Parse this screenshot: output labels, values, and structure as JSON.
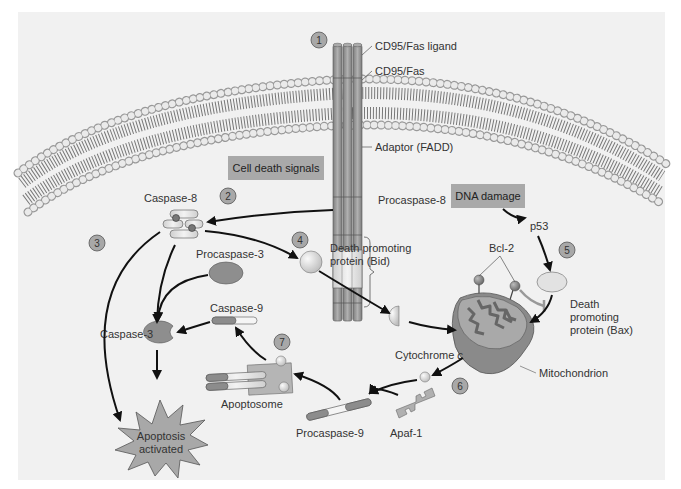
{
  "diagram": {
    "colors": {
      "background": "#f1f1f1",
      "signal_box": "#a9a9a9",
      "receptor": "#9a9a9a",
      "protein": "#8c8c8c",
      "light_protein": "#dcdcdc",
      "mitochondrion": "#8a8a8a",
      "arrow": "#111111"
    },
    "steps": [
      "1",
      "2",
      "3",
      "4",
      "5",
      "6",
      "7"
    ],
    "signal_boxes": {
      "cell_death": "Cell death signals",
      "dna_damage": "DNA damage"
    },
    "labels": {
      "cd95_ligand": "CD95/Fas ligand",
      "cd95_fas": "CD95/Fas",
      "adaptor": "Adaptor (FADD)",
      "procaspase8": "Procaspase-8",
      "caspase8": "Caspase-8",
      "procaspase3": "Procaspase-3",
      "caspase3": "Caspase-3",
      "caspase9": "Caspase-9",
      "bid_line1": "Death promoting",
      "bid_line2": "protein (Bid)",
      "p53": "p53",
      "bcl2": "Bcl-2",
      "bax_line1": "Death",
      "bax_line2": "promoting",
      "bax_line3": "protein (Bax)",
      "cytochrome": "Cytochrome ",
      "cytochrome_italic": "c",
      "mitochondrion": "Mitochondrion",
      "apoptosome": "Apoptosome",
      "procaspase9": "Procaspase-9",
      "apaf1": "Apaf-1",
      "apoptosis_line1": "Apoptosis",
      "apoptosis_line2": "activated"
    }
  }
}
